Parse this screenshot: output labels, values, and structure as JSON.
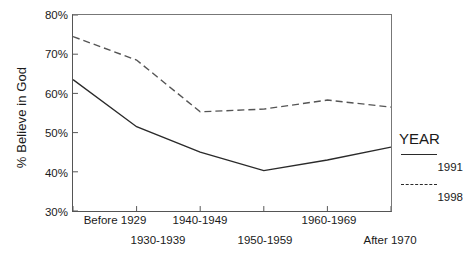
{
  "chart_data": {
    "type": "line",
    "title": "",
    "xlabel": "",
    "ylabel": "% Believe in God",
    "categories": [
      "Before 1929",
      "1930-1939",
      "1940-1949",
      "1950-1959",
      "1960-1969",
      "After 1970"
    ],
    "ylim": [
      30,
      80
    ],
    "yticks": [
      30,
      40,
      50,
      60,
      70,
      80
    ],
    "ytick_labels": [
      "30%",
      "40%",
      "50%",
      "60%",
      "70%",
      "80%"
    ],
    "grid": false,
    "legend_position": "right",
    "legend_title": "YEAR",
    "series": [
      {
        "name": "1991",
        "style": "solid",
        "color": "#2a2a2a",
        "values": [
          63.5,
          51.5,
          45.0,
          40.3,
          43.0,
          46.3
        ]
      },
      {
        "name": "1998",
        "style": "dashed",
        "color": "#555555",
        "values": [
          74.5,
          68.5,
          55.3,
          56.0,
          58.3,
          56.5
        ]
      }
    ]
  },
  "axes": {
    "ylabel": "% Believe in God",
    "ytick_labels": [
      "80%",
      "70%",
      "60%",
      "50%",
      "40%",
      "30%"
    ],
    "xtick_labels_row_top": [
      "Before 1929",
      "1940-1949",
      "1960-1969"
    ],
    "xtick_labels_row_bottom": [
      "1930-1939",
      "1950-1959",
      "After 1970"
    ]
  },
  "legend": {
    "title": "YEAR",
    "entries": [
      {
        "label": "1991",
        "style": "solid"
      },
      {
        "label": "1998",
        "style": "dashed"
      }
    ]
  }
}
